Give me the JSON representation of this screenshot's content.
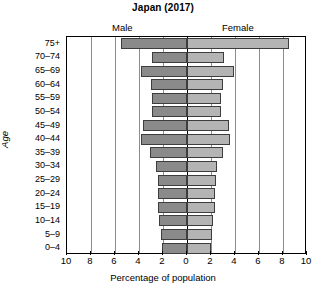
{
  "chart_data": {
    "type": "bar",
    "chart_subtype": "population-pyramid",
    "title": "Japan (2017)",
    "xlabel": "Percentage of population",
    "ylabel": "Age",
    "categories": [
      "0–4",
      "5–9",
      "10–14",
      "15–19",
      "20–24",
      "25–29",
      "30–34",
      "35–39",
      "40–44",
      "45–49",
      "50–54",
      "55–59",
      "60–64",
      "65–69",
      "70–74",
      "75+"
    ],
    "series": [
      {
        "name": "Male",
        "color": "#8a8a8a",
        "side": "left",
        "values": [
          2.1,
          2.2,
          2.3,
          2.4,
          2.4,
          2.4,
          2.6,
          3.1,
          3.8,
          3.7,
          2.9,
          2.9,
          3.0,
          3.8,
          2.9,
          5.5
        ]
      },
      {
        "name": "Female",
        "color": "#b4b4b4",
        "side": "right",
        "values": [
          2.0,
          2.1,
          2.2,
          2.3,
          2.3,
          2.4,
          2.5,
          3.0,
          3.6,
          3.5,
          2.8,
          2.8,
          3.0,
          3.9,
          3.1,
          8.5
        ]
      }
    ],
    "xlim": [
      -10,
      10
    ],
    "x_tick_values": [
      -10,
      -8,
      -6,
      -4,
      -2,
      0,
      2,
      4,
      6,
      8,
      10
    ],
    "x_tick_labels": [
      "10",
      "8",
      "6",
      "4",
      "2",
      "0",
      "2",
      "4",
      "6",
      "8",
      "10"
    ],
    "grid": true,
    "grid_axis": "x",
    "legend_position": "above-plot",
    "axis_unit": "percent"
  },
  "labels": {
    "male": "Male",
    "female": "Female"
  }
}
